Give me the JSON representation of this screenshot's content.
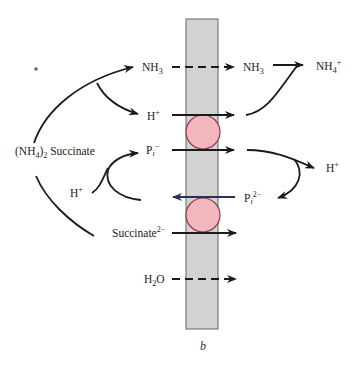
{
  "figure": {
    "caption": "b",
    "colors": {
      "membrane_fill": "#d2d2d2",
      "membrane_edge": "#555555",
      "carrier_fill": "#f2b6bf",
      "carrier_edge": "#8a3a44",
      "arrow": "#1a1a1a",
      "antiport_arrow": "#2a2f5c"
    },
    "source": {
      "label_main": "(NH",
      "label_sub": "4",
      "label_close": ")",
      "label_sub2": "2",
      "label_rest": " Succinate"
    },
    "left_labels": {
      "nh3": {
        "base": "NH",
        "sub": "3"
      },
      "h_plus": {
        "base": "H",
        "sup": "+"
      },
      "pi_minus": {
        "base": "P",
        "sub": "i",
        "sup": "−"
      },
      "h_plus_left": {
        "base": "H",
        "sup": "+"
      },
      "succinate": {
        "base": "Succinate",
        "sup": "2−"
      },
      "h2o": {
        "base": "H",
        "sub": "2",
        "rest": "O"
      }
    },
    "right_labels": {
      "nh3": {
        "base": "NH",
        "sub": "3"
      },
      "nh4": {
        "base": "NH",
        "sub": "4",
        "sup": "+"
      },
      "h_plus": {
        "base": "H",
        "sup": "+"
      },
      "pi2": {
        "base": "P",
        "sub": "i",
        "sup": "2−"
      }
    },
    "transports": [
      {
        "species": "NH3",
        "direction": "right",
        "style": "dashed (diffusion)"
      },
      {
        "species": "H+",
        "direction": "right",
        "style": "solid (carrier)"
      },
      {
        "species": "Pi-",
        "direction": "right",
        "style": "solid (carrier)"
      },
      {
        "species": "Pi2-",
        "direction": "left",
        "style": "solid (antiport)"
      },
      {
        "species": "Succinate2-",
        "direction": "right",
        "style": "solid (carrier)"
      },
      {
        "species": "H2O",
        "direction": "right",
        "style": "dashed (diffusion)"
      }
    ]
  }
}
